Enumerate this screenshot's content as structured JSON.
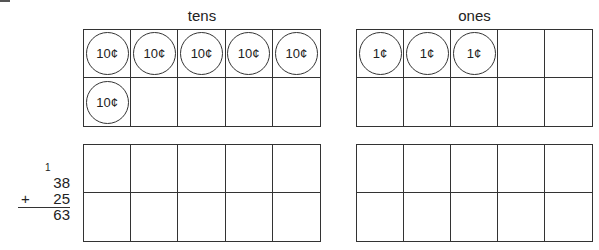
{
  "labels": {
    "tens": "tens",
    "ones": "ones"
  },
  "top_tens_grid": {
    "cells": [
      "10¢",
      "10¢",
      "10¢",
      "10¢",
      "10¢",
      "10¢",
      "",
      "",
      "",
      ""
    ]
  },
  "top_ones_grid": {
    "cells": [
      "1¢",
      "1¢",
      "1¢",
      "",
      "",
      "",
      "",
      "",
      "",
      ""
    ]
  },
  "bottom_tens_grid": {
    "cells": [
      "",
      "",
      "",
      "",
      "",
      "",
      "",
      "",
      "",
      ""
    ]
  },
  "bottom_ones_grid": {
    "cells": [
      "",
      "",
      "",
      "",
      "",
      "",
      "",
      "",
      "",
      ""
    ]
  },
  "addition_problem": {
    "carry": "1",
    "addend1": "38",
    "operator": "+",
    "addend2": "25",
    "sum": "63"
  }
}
